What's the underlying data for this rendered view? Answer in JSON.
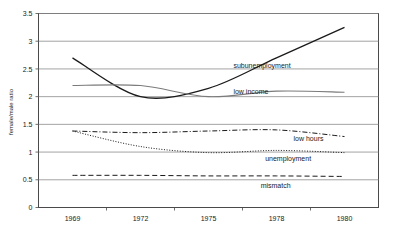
{
  "chart_data": {
    "type": "line",
    "title": "",
    "xlabel": "",
    "ylabel": "female/male ratio",
    "x": [
      1969,
      1972,
      1975,
      1978,
      1980
    ],
    "categories": [
      "1969",
      "1972",
      "1975",
      "1978",
      "1980"
    ],
    "xticklabels": [
      "1969",
      "1972",
      "1975",
      "1978",
      "1980"
    ],
    "yticklabels": [
      "0",
      "0.5",
      "1",
      "1.5",
      "2",
      "2.5",
      "3",
      "3.5"
    ],
    "ytickvalues": [
      0,
      0.5,
      1,
      1.5,
      2,
      2.5,
      3,
      3.5
    ],
    "ylim": [
      0,
      3.5
    ],
    "grid": "horizontal",
    "legend_position": "inline-annotations",
    "series": [
      {
        "name": "subunemployment",
        "label": "subunemployment",
        "values": [
          2.7,
          2.0,
          2.15,
          2.7,
          3.25
        ],
        "style": "solid",
        "color": "#1a1a1a",
        "width": 1.3,
        "label_x": 1976.1,
        "label_y": 2.52
      },
      {
        "name": "low income",
        "label": "low income",
        "values": [
          2.2,
          2.2,
          2.0,
          2.1,
          2.08
        ],
        "style": "solid",
        "color": "#7b7b7b",
        "width": 1.1,
        "label_x": 1976.1,
        "label_y": 2.05
      },
      {
        "name": "low hours",
        "label": "low hours",
        "values": [
          1.38,
          1.35,
          1.38,
          1.4,
          1.28
        ],
        "style": "dashdot",
        "color": "#1a1a1a",
        "width": 1.0,
        "label_x": 1978.5,
        "label_y": 1.2
      },
      {
        "name": "unemployment",
        "label": "unemployment",
        "values": [
          1.38,
          1.1,
          0.99,
          1.03,
          0.99
        ],
        "style": "dotted",
        "color": "#1a1a1a",
        "width": 1.0,
        "label_x": 1977.5,
        "label_y": 0.83
      },
      {
        "name": "mismatch",
        "label": "mismatch",
        "values": [
          0.58,
          0.58,
          0.57,
          0.57,
          0.56
        ],
        "style": "dashed",
        "color": "#1a1a1a",
        "width": 1.0,
        "label_x": 1977.3,
        "label_y": 0.35
      }
    ]
  },
  "axes": {
    "y_title": "female/male ratio",
    "y_ticks": [
      "3.5",
      "3",
      "2.5",
      "2",
      "1.5",
      "1",
      "0.5",
      "0"
    ],
    "x_ticks": [
      "1969",
      "1972",
      "1975",
      "1978",
      "1980"
    ]
  },
  "annotations": {
    "subunemployment": "subunemployment",
    "low_income": "low income",
    "low_hours": "low hours",
    "unemployment": "unemployment",
    "mismatch": "mismatch"
  },
  "colors": {
    "plot_border": "#4a4a4a",
    "gridline": "#8c8c8c",
    "primary_series": "#1a1a1a",
    "secondary_series": "#7b7b7b",
    "text": "#1a1a1a",
    "background": "#ffffff"
  }
}
